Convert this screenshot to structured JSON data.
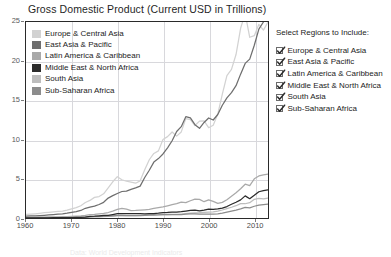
{
  "header": {
    "title": "Gross Domestic Product (Current USD in Trillions)"
  },
  "panel": {
    "title": "Select Regions to Include:",
    "checkbox_icon": "check-icon",
    "options": [
      {
        "label": "Europe & Central Asia",
        "checked": true
      },
      {
        "label": "East Asia & Pacific",
        "checked": true
      },
      {
        "label": "Latin America & Caribbean",
        "checked": true
      },
      {
        "label": "Middle East & North Africa",
        "checked": true
      },
      {
        "label": "South Asia",
        "checked": true
      },
      {
        "label": "Sub-Saharan Africa",
        "checked": true
      }
    ]
  },
  "caption": {
    "text": "Data: World Development Indicators"
  },
  "chart_data": {
    "type": "line",
    "title": "Gross Domestic Product (Current USD in Trillions)",
    "xlabel": "",
    "ylabel": "",
    "xlim": [
      1960,
      2013
    ],
    "ylim": [
      0,
      25
    ],
    "yticks": [
      0,
      5,
      10,
      15,
      20,
      25
    ],
    "xticks": [
      1960,
      1970,
      1980,
      1990,
      2000,
      2010
    ],
    "grid": true,
    "legend_position": "top-left-inside",
    "x": [
      1960,
      1961,
      1962,
      1963,
      1964,
      1965,
      1966,
      1967,
      1968,
      1969,
      1970,
      1971,
      1972,
      1973,
      1974,
      1975,
      1976,
      1977,
      1978,
      1979,
      1980,
      1981,
      1982,
      1983,
      1984,
      1985,
      1986,
      1987,
      1988,
      1989,
      1990,
      1991,
      1992,
      1993,
      1994,
      1995,
      1996,
      1997,
      1998,
      1999,
      2000,
      2001,
      2002,
      2003,
      2004,
      2005,
      2006,
      2007,
      2008,
      2009,
      2010,
      2011,
      2012,
      2013
    ],
    "series": [
      {
        "name": "Europe & Central Asia",
        "color": "#d2d2d2",
        "values": [
          0.45,
          0.49,
          0.54,
          0.6,
          0.67,
          0.73,
          0.79,
          0.85,
          0.89,
          1.0,
          1.17,
          1.32,
          1.56,
          1.98,
          2.24,
          2.63,
          2.74,
          3.09,
          3.84,
          4.62,
          5.27,
          4.88,
          4.69,
          4.58,
          4.44,
          4.74,
          6.16,
          7.43,
          8.23,
          8.56,
          10.02,
          10.38,
          10.97,
          10.44,
          10.98,
          12.67,
          12.56,
          11.79,
          12.36,
          12.4,
          11.52,
          11.83,
          13.25,
          15.79,
          18.17,
          18.96,
          20.85,
          24.2,
          26.08,
          23.05,
          23.26,
          24.7,
          23.97,
          25.0
        ]
      },
      {
        "name": "East Asia & Pacific",
        "color": "#6e6e6e",
        "values": [
          0.25,
          0.26,
          0.28,
          0.31,
          0.35,
          0.39,
          0.44,
          0.48,
          0.53,
          0.62,
          0.73,
          0.8,
          0.96,
          1.24,
          1.38,
          1.51,
          1.72,
          2.0,
          2.54,
          2.85,
          3.13,
          3.38,
          3.42,
          3.65,
          3.84,
          4.06,
          5.17,
          6.09,
          7.13,
          7.58,
          8.17,
          8.95,
          9.85,
          11.04,
          11.65,
          12.92,
          12.76,
          11.9,
          11.44,
          12.19,
          12.76,
          12.5,
          13.2,
          14.38,
          15.33,
          16.0,
          16.88,
          18.35,
          19.72,
          20.26,
          22.03,
          24.1,
          25.0,
          26.0
        ]
      },
      {
        "name": "Latin America & Caribbean",
        "color": "#a9a9a9",
        "values": [
          0.08,
          0.09,
          0.09,
          0.1,
          0.12,
          0.13,
          0.14,
          0.15,
          0.17,
          0.19,
          0.21,
          0.24,
          0.27,
          0.34,
          0.43,
          0.47,
          0.53,
          0.6,
          0.7,
          0.87,
          1.09,
          1.22,
          1.13,
          0.94,
          0.96,
          1.0,
          1.05,
          1.11,
          1.22,
          1.31,
          1.41,
          1.55,
          1.7,
          1.83,
          2.03,
          1.96,
          2.2,
          2.4,
          2.38,
          2.08,
          2.32,
          2.12,
          1.87,
          1.99,
          2.33,
          2.76,
          3.21,
          3.73,
          4.31,
          4.13,
          5.0,
          5.36,
          5.5,
          5.6
        ]
      },
      {
        "name": "Middle East & North Africa",
        "color": "#2b2b2b",
        "values": [
          0.02,
          0.02,
          0.02,
          0.03,
          0.03,
          0.03,
          0.04,
          0.04,
          0.05,
          0.05,
          0.06,
          0.07,
          0.09,
          0.12,
          0.21,
          0.23,
          0.28,
          0.32,
          0.34,
          0.44,
          0.55,
          0.57,
          0.55,
          0.56,
          0.56,
          0.55,
          0.52,
          0.55,
          0.57,
          0.62,
          0.7,
          0.71,
          0.76,
          0.76,
          0.8,
          0.88,
          0.96,
          0.99,
          0.9,
          1.0,
          1.14,
          1.11,
          1.15,
          1.27,
          1.46,
          1.75,
          2.01,
          2.31,
          2.82,
          2.46,
          2.89,
          3.35,
          3.5,
          3.6
        ]
      },
      {
        "name": "South Asia",
        "color": "#bdbdbd",
        "values": [
          0.05,
          0.05,
          0.05,
          0.06,
          0.07,
          0.07,
          0.07,
          0.08,
          0.08,
          0.09,
          0.1,
          0.1,
          0.11,
          0.13,
          0.15,
          0.16,
          0.16,
          0.19,
          0.22,
          0.24,
          0.27,
          0.28,
          0.29,
          0.31,
          0.31,
          0.34,
          0.36,
          0.4,
          0.43,
          0.43,
          0.47,
          0.43,
          0.46,
          0.46,
          0.51,
          0.57,
          0.62,
          0.65,
          0.68,
          0.73,
          0.75,
          0.78,
          0.87,
          1.02,
          1.2,
          1.37,
          1.57,
          1.84,
          1.82,
          1.95,
          2.39,
          2.5,
          2.45,
          2.55
        ]
      },
      {
        "name": "Sub-Saharan Africa",
        "color": "#8c8c8c",
        "values": [
          0.03,
          0.03,
          0.03,
          0.04,
          0.04,
          0.05,
          0.05,
          0.05,
          0.06,
          0.06,
          0.07,
          0.08,
          0.09,
          0.11,
          0.15,
          0.16,
          0.18,
          0.21,
          0.23,
          0.28,
          0.34,
          0.33,
          0.31,
          0.3,
          0.29,
          0.29,
          0.32,
          0.36,
          0.38,
          0.4,
          0.44,
          0.45,
          0.44,
          0.42,
          0.42,
          0.49,
          0.52,
          0.53,
          0.5,
          0.49,
          0.5,
          0.48,
          0.52,
          0.62,
          0.75,
          0.88,
          1.01,
          1.16,
          1.35,
          1.29,
          1.5,
          1.65,
          1.72,
          1.78
        ]
      }
    ]
  }
}
